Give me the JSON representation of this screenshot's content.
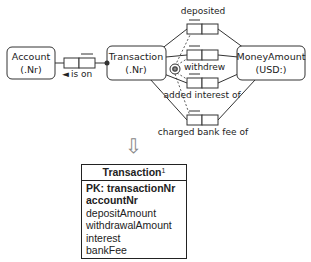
{
  "orm_diagram": {
    "entities": [
      {
        "name": "Account",
        "ref": "(.Nr)"
      },
      {
        "name": "Transaction",
        "ref": "(.Nr)"
      },
      {
        "name": "MoneyAmount",
        "ref": "(USD:)"
      }
    ],
    "fact_types": [
      {
        "reading": "is on",
        "direction": "◄"
      },
      {
        "reading": "deposited"
      },
      {
        "reading": "withdrew"
      },
      {
        "reading": "added interest of"
      },
      {
        "reading": "charged bank fee of"
      }
    ],
    "constraint_symbol": "exclusive-or"
  },
  "mapping_arrow": "⇩",
  "relational_table": {
    "name": "Transaction",
    "footnote": "1",
    "columns": [
      {
        "label": "PK: transactionNr",
        "bold": true
      },
      {
        "label": "accountNr",
        "bold": true
      },
      {
        "label": "depositAmount",
        "bold": false
      },
      {
        "label": "withdrawalAmount",
        "bold": false
      },
      {
        "label": "interest",
        "bold": false
      },
      {
        "label": "bankFee",
        "bold": false
      }
    ]
  }
}
